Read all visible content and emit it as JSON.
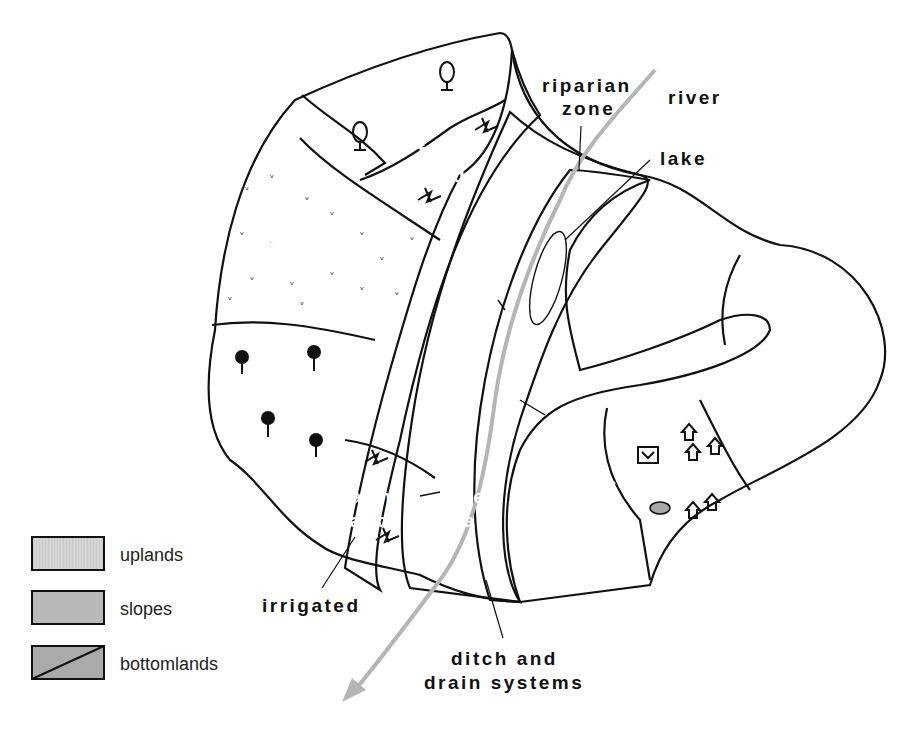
{
  "colors": {
    "uplands": "#d3d3d3",
    "slopes": "#b8b8b8",
    "bottomlands": "#a9a9a9",
    "river": "#b5b5b5",
    "outline": "#111111",
    "background": "#ffffff"
  },
  "map_labels": {
    "forest": "forest",
    "farmland_top_1": "farm-",
    "farmland_top_2": "land",
    "pasture": "pasture",
    "bush": "bush",
    "farmland_bottom_1": "farm-",
    "farmland_bottom_2": "land",
    "wetland_1": "wet-",
    "wetland_2": "land",
    "settlement": "settlement"
  },
  "callouts": {
    "riparian_1": "riparian",
    "riparian_2": "zone",
    "river": "river",
    "lake": "lake",
    "irrigated": "irrigated",
    "ditch_1": "ditch and",
    "ditch_2": "drain systems"
  },
  "legend": {
    "items": [
      {
        "label": "uplands",
        "pattern": "uplands"
      },
      {
        "label": "slopes",
        "pattern": "slopes"
      },
      {
        "label": "bottomlands",
        "pattern": "bottomlands"
      }
    ]
  },
  "icons": [
    "tree-icon",
    "grass-tuft-icon",
    "pasture-sprig-icon",
    "palm-icon",
    "house-icon",
    "factory-icon",
    "pond-icon"
  ]
}
